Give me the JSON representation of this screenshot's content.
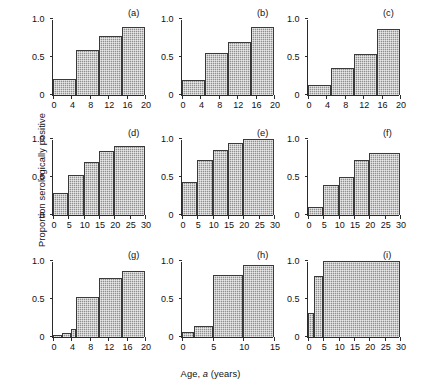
{
  "figure": {
    "xlabel_prefix": "Age, ",
    "xlabel_var": "a",
    "xlabel_suffix": " (years)",
    "ylabel": "Proportion serologically positive"
  },
  "chart_data": {
    "type": "bar",
    "title": "",
    "xlabel": "Age, a (years)",
    "ylabel": "Proportion serologically positive",
    "ylim": [
      0,
      1
    ],
    "yticks": [
      0,
      0.5,
      1
    ],
    "ytick_labels": [
      "0",
      "0.5",
      "1.0"
    ],
    "grid": false,
    "legend": "none",
    "note": "Nine panels (a)-(i) of age-stratified seroprevalence histograms; bars are step histograms over age intervals.",
    "panels": [
      {
        "label": "(a)",
        "xlim": [
          0,
          20
        ],
        "xticks": [
          0,
          4,
          8,
          12,
          16,
          20
        ],
        "xtick_labels": [
          "0",
          "4",
          "8",
          "12",
          "16",
          "20"
        ],
        "bins": [
          [
            0,
            5
          ],
          [
            5,
            10
          ],
          [
            10,
            15
          ],
          [
            15,
            20
          ]
        ],
        "values": [
          0.21,
          0.59,
          0.78,
          0.9
        ]
      },
      {
        "label": "(b)",
        "xlim": [
          0,
          20
        ],
        "xticks": [
          0,
          4,
          8,
          12,
          16,
          20
        ],
        "xtick_labels": [
          "0",
          "4",
          "8",
          "12",
          "16",
          "20"
        ],
        "bins": [
          [
            0,
            5
          ],
          [
            5,
            10
          ],
          [
            10,
            15
          ],
          [
            15,
            20
          ]
        ],
        "values": [
          0.2,
          0.55,
          0.7,
          0.89
        ]
      },
      {
        "label": "(c)",
        "xlim": [
          0,
          20
        ],
        "xticks": [
          0,
          4,
          8,
          12,
          16,
          20
        ],
        "xtick_labels": [
          "0",
          "4",
          "8",
          "12",
          "16",
          "20"
        ],
        "bins": [
          [
            0,
            5
          ],
          [
            5,
            10
          ],
          [
            10,
            15
          ],
          [
            15,
            20
          ]
        ],
        "values": [
          0.13,
          0.35,
          0.54,
          0.87
        ]
      },
      {
        "label": "(d)",
        "xlim": [
          0,
          30
        ],
        "xticks": [
          0,
          5,
          10,
          15,
          20,
          25,
          30
        ],
        "xtick_labels": [
          "0",
          "5",
          "10",
          "15",
          "20",
          "25",
          "30"
        ],
        "bins": [
          [
            0,
            5
          ],
          [
            5,
            10
          ],
          [
            10,
            15
          ],
          [
            15,
            20
          ],
          [
            20,
            30
          ]
        ],
        "values": [
          0.29,
          0.53,
          0.7,
          0.84,
          0.91
        ]
      },
      {
        "label": "(e)",
        "xlim": [
          0,
          30
        ],
        "xticks": [
          0,
          5,
          10,
          15,
          20,
          25,
          30
        ],
        "xtick_labels": [
          "0",
          "5",
          "10",
          "15",
          "20",
          "25",
          "30"
        ],
        "bins": [
          [
            0,
            5
          ],
          [
            5,
            10
          ],
          [
            10,
            15
          ],
          [
            15,
            20
          ],
          [
            20,
            30
          ]
        ],
        "values": [
          0.43,
          0.72,
          0.85,
          0.95,
          1.0
        ]
      },
      {
        "label": "(f)",
        "xlim": [
          0,
          30
        ],
        "xticks": [
          0,
          5,
          10,
          15,
          20,
          25,
          30
        ],
        "xtick_labels": [
          "0",
          "5",
          "10",
          "15",
          "20",
          "25",
          "30"
        ],
        "bins": [
          [
            0,
            5
          ],
          [
            5,
            10
          ],
          [
            10,
            15
          ],
          [
            15,
            20
          ],
          [
            20,
            30
          ]
        ],
        "values": [
          0.1,
          0.4,
          0.5,
          0.72,
          0.81
        ]
      },
      {
        "label": "(g)",
        "xlim": [
          0,
          20
        ],
        "xticks": [
          0,
          4,
          8,
          12,
          16,
          20
        ],
        "xtick_labels": [
          "0",
          "4",
          "8",
          "12",
          "16",
          "20"
        ],
        "bins": [
          [
            0,
            2
          ],
          [
            2,
            4
          ],
          [
            4,
            5
          ],
          [
            5,
            10
          ],
          [
            10,
            15
          ],
          [
            15,
            20
          ]
        ],
        "values": [
          0.03,
          0.05,
          0.1,
          0.53,
          0.78,
          0.87
        ]
      },
      {
        "label": "(h)",
        "xlim": [
          0,
          15
        ],
        "xticks": [
          0,
          5,
          10,
          15
        ],
        "xtick_labels": [
          "0",
          "5",
          "10",
          "15"
        ],
        "bins": [
          [
            0,
            2
          ],
          [
            2,
            5
          ],
          [
            5,
            10
          ],
          [
            10,
            15
          ]
        ],
        "values": [
          0.06,
          0.14,
          0.82,
          0.95
        ]
      },
      {
        "label": "(i)",
        "xlim": [
          0,
          30
        ],
        "xticks": [
          0,
          5,
          10,
          15,
          20,
          25,
          30
        ],
        "xtick_labels": [
          "0",
          "5",
          "10",
          "15",
          "20",
          "25",
          "30"
        ],
        "bins": [
          [
            0,
            2
          ],
          [
            2,
            5
          ],
          [
            5,
            30
          ]
        ],
        "values": [
          0.31,
          0.8,
          1.0
        ]
      }
    ]
  }
}
